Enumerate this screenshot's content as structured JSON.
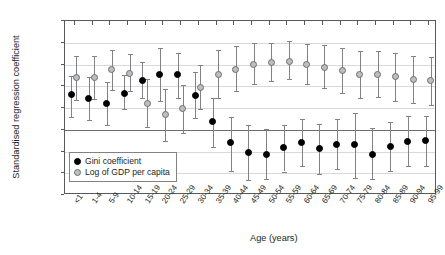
{
  "chart_data": {
    "type": "scatter",
    "title": "",
    "xlabel": "Age (years)",
    "ylabel": "Standardised regression coefficient",
    "ylim": [
      -0.75,
      1.25
    ],
    "yticks": [
      "1.25",
      "1.00",
      "0.75",
      "0.50",
      "0.25",
      "0.00",
      "-0.25",
      "-0.50",
      "-0.75"
    ],
    "ytick_values": [
      1.25,
      1.0,
      0.75,
      0.5,
      0.25,
      0.0,
      -0.25,
      -0.5,
      -0.75
    ],
    "grid": true,
    "legend_position": "inside-bottom-left",
    "categories": [
      "<1",
      "1-4",
      "5-9",
      "10-14",
      "15-19",
      "20-24",
      "25-29",
      "30-34",
      "35-39",
      "40-44",
      "45-49",
      "50-54",
      "55-59",
      "60-64",
      "65-69",
      "70-74",
      "75-79",
      "80-84",
      "85-89",
      "90-94",
      "95-99"
    ],
    "series": [
      {
        "name": "Gini coefficient",
        "marker": "filled-circle",
        "color": "#000000",
        "values": [
          0.4,
          0.36,
          0.3,
          0.42,
          0.57,
          0.64,
          0.63,
          0.39,
          0.09,
          -0.15,
          -0.26,
          -0.29,
          -0.2,
          -0.15,
          -0.22,
          -0.17,
          -0.17,
          -0.28,
          -0.19,
          -0.13,
          -0.12
        ],
        "ci_lower": [
          0.15,
          0.11,
          0.05,
          0.24,
          0.36,
          0.33,
          0.36,
          0.14,
          -0.2,
          -0.47,
          -0.58,
          -0.57,
          -0.48,
          -0.42,
          -0.51,
          -0.45,
          -0.55,
          -0.57,
          -0.47,
          -0.42,
          -0.42
        ],
        "ci_upper": [
          0.62,
          0.61,
          0.55,
          0.63,
          0.78,
          0.94,
          0.88,
          0.66,
          0.36,
          0.15,
          0.05,
          0.01,
          0.06,
          0.12,
          0.07,
          0.12,
          0.19,
          0.02,
          0.09,
          0.16,
          0.16
        ]
      },
      {
        "name": "Log of GDP per capita",
        "marker": "open-circle",
        "color": "#bcbec0",
        "values": [
          0.6,
          0.6,
          0.69,
          0.65,
          0.3,
          0.17,
          0.24,
          0.49,
          0.64,
          0.69,
          0.75,
          0.77,
          0.79,
          0.75,
          0.72,
          0.68,
          0.63,
          0.64,
          0.61,
          0.58,
          0.57
        ],
        "ci_lower": [
          0.34,
          0.35,
          0.46,
          0.45,
          0.03,
          -0.13,
          -0.04,
          0.24,
          0.37,
          0.44,
          0.53,
          0.56,
          0.58,
          0.53,
          0.48,
          0.42,
          0.36,
          0.38,
          0.33,
          0.31,
          0.29
        ],
        "ci_upper": [
          0.85,
          0.85,
          0.92,
          0.87,
          0.58,
          0.47,
          0.51,
          0.74,
          0.92,
          0.96,
          1.0,
          1.0,
          1.02,
          0.99,
          0.97,
          0.94,
          0.91,
          0.91,
          0.88,
          0.85,
          0.84
        ]
      }
    ]
  },
  "legend": {
    "items": [
      {
        "label": "Gini coefficient",
        "swatch": "gini"
      },
      {
        "label": "Log of GDP per capita",
        "swatch": "gdp"
      }
    ]
  },
  "axis": {
    "y_title": "Standardised regression coefficient",
    "x_title": "Age (years)"
  }
}
